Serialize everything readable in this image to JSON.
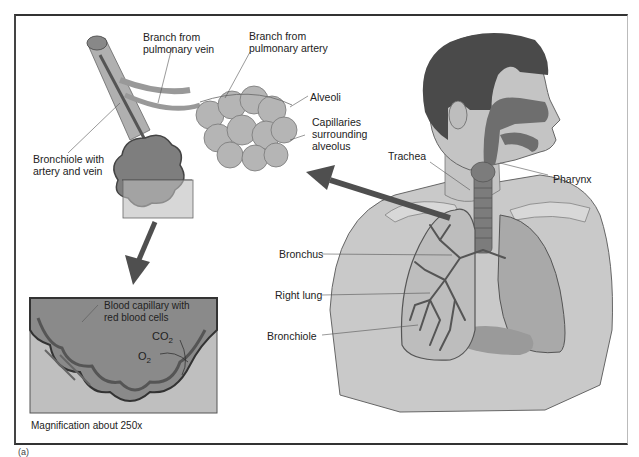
{
  "figure_label": "(a)",
  "colors": {
    "skin": "#c9c9c9",
    "hair": "#4a4a4a",
    "airway": "#6e6e6e",
    "lung_left": "#a9a9a9",
    "lung_right_bg": "#bdbdbd",
    "bronchi": "#555555",
    "alveoli": "#b5b5b5",
    "capillary_lines": "#777777",
    "arrow": "#4f4f4f",
    "frame": "#333333",
    "inset_bg": "#bfbfbf",
    "inset_center": "#8a8a8a"
  },
  "labels": {
    "branch_vein": "Branch from\npulmonary vein",
    "branch_artery": "Branch from\npulmonary artery",
    "alveoli": "Alveoli",
    "capillaries": "Capillaries\nsurrounding\nalveolus",
    "bronchiole_artery_vein": "Bronchiole with\nartery and vein",
    "trachea": "Trachea",
    "pharynx": "Pharynx",
    "bronchus": "Bronchus",
    "right_lung": "Right lung",
    "bronchiole": "Bronchiole",
    "blood_capillary": "Blood capillary with\nred blood cells",
    "co2": "CO",
    "co2_sub": "2",
    "o2": "O",
    "o2_sub": "2",
    "magnification": "Magnification about 250x"
  }
}
